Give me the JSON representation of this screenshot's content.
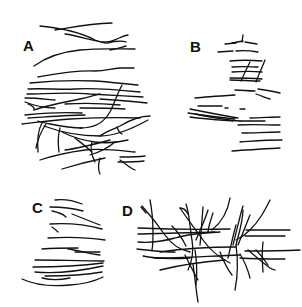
{
  "figure": {
    "panels": [
      {
        "id": "A",
        "label": "A"
      },
      {
        "id": "B",
        "label": "B"
      },
      {
        "id": "C",
        "label": "C"
      },
      {
        "id": "D",
        "label": "D"
      }
    ],
    "line_color": "#111111",
    "background": "#ffffff"
  }
}
